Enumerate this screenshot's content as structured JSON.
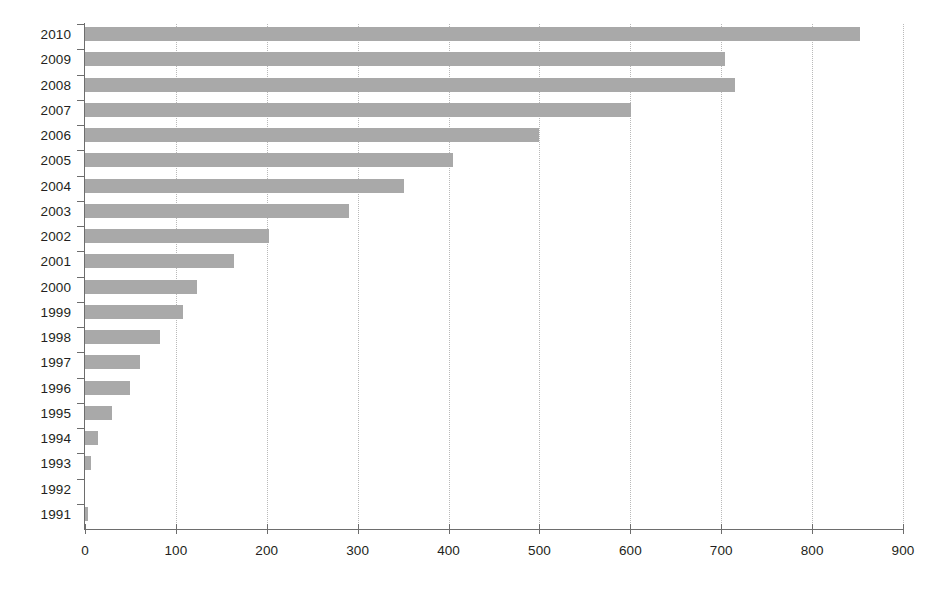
{
  "chart_data": {
    "type": "bar",
    "orientation": "horizontal",
    "title": "",
    "subtitle": "",
    "xlabel": "",
    "ylabel": "",
    "xlim": [
      0,
      900
    ],
    "ylim": null,
    "grid": "vertical-dotted",
    "legend": null,
    "bar_color": "#a9a9a9",
    "axis_color": "#6d6d6d",
    "gridline_color": "#b9b9b9",
    "text_color": "#231f20",
    "xticks": [
      0,
      100,
      200,
      300,
      400,
      500,
      600,
      700,
      800,
      900
    ],
    "xtick_labels": [
      "0",
      "100",
      "200",
      "300",
      "400",
      "500",
      "600",
      "700",
      "800",
      "900"
    ],
    "categories": [
      "2010",
      "2009",
      "2008",
      "2007",
      "2006",
      "2005",
      "2004",
      "2003",
      "2002",
      "2001",
      "2000",
      "1999",
      "1998",
      "1997",
      "1996",
      "1995",
      "1994",
      "1993",
      "1992",
      "1991"
    ],
    "values": [
      853,
      704,
      715,
      601,
      499,
      405,
      351,
      291,
      202,
      164,
      123,
      108,
      82,
      60,
      49,
      30,
      14,
      7,
      0,
      3
    ]
  }
}
